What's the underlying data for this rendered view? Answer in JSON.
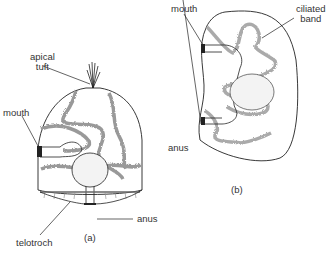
{
  "figure_a": {
    "caption": "(a)",
    "labels": {
      "apical_tuft_1": "apical",
      "apical_tuft_2": "tuft",
      "mouth": "mouth",
      "anus": "anus",
      "telotroch": "telotroch"
    }
  },
  "figure_b": {
    "caption": "(b)",
    "labels": {
      "mouth": "mouth",
      "ciliated_band_1": "ciliated",
      "ciliated_band_2": "band",
      "anus": "anus"
    }
  },
  "colors": {
    "line": "#222222",
    "band": "#999999",
    "text": "#333333"
  }
}
